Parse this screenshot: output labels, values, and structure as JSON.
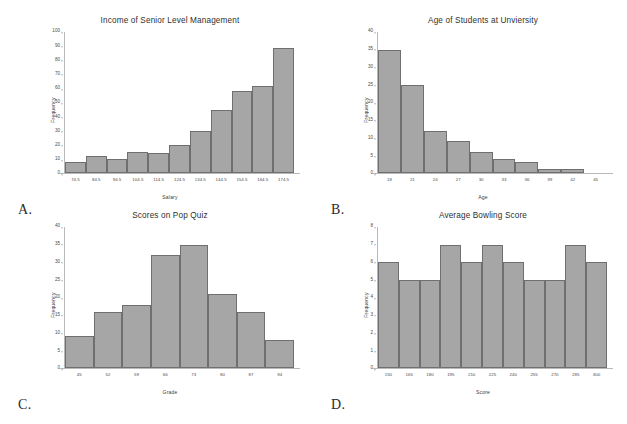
{
  "page": {
    "ghost_bleed_text": " ",
    "panel_letters": [
      "A.",
      "B.",
      "C.",
      "D."
    ]
  },
  "chart_data": [
    {
      "id": "income-senior-level-management",
      "panel": "A.",
      "type": "bar",
      "title": "Income of Senior Level Management",
      "xlabel": "Salary",
      "ylabel": "Frequency",
      "categories": [
        "74.5",
        "84.5",
        "94.5",
        "104.5",
        "114.5",
        "124.5",
        "134.5",
        "144.5",
        "154.5",
        "164.5",
        "174.5"
      ],
      "values": [
        8,
        12,
        10,
        15,
        14,
        20,
        30,
        45,
        58,
        62,
        89
      ],
      "yticks": [
        0,
        10,
        20,
        30,
        40,
        50,
        60,
        70,
        80,
        90,
        100
      ],
      "ylim": [
        0,
        100
      ],
      "grid": false,
      "legend": "none",
      "bar_fill": "#a6a6a6",
      "bar_stroke": "#6f6f6f"
    },
    {
      "id": "age-of-students-at-university",
      "panel": "B.",
      "type": "bar",
      "title": "Age of Students at Unviersity",
      "xlabel": "Age",
      "ylabel": "Frequency",
      "categories": [
        "18",
        "21",
        "24",
        "27",
        "30",
        "33",
        "36",
        "39",
        "42",
        "45"
      ],
      "values": [
        35,
        25,
        12,
        9,
        6,
        4,
        3,
        1,
        1
      ],
      "yticks": [
        0,
        5,
        10,
        15,
        20,
        25,
        30,
        35,
        40
      ],
      "ylim": [
        0,
        40
      ],
      "grid": false,
      "legend": "none",
      "bar_fill": "#a6a6a6",
      "bar_stroke": "#6f6f6f"
    },
    {
      "id": "scores-on-pop-quiz",
      "panel": "C.",
      "type": "bar",
      "title": "Scores on Pop Quiz",
      "xlabel": "Grade",
      "ylabel": "Frequency",
      "categories": [
        "45",
        "52",
        "59",
        "66",
        "73",
        "80",
        "87",
        "94"
      ],
      "values": [
        9,
        16,
        18,
        32,
        35,
        21,
        16,
        8
      ],
      "yticks": [
        0,
        5,
        10,
        15,
        20,
        25,
        30,
        35,
        40
      ],
      "ylim": [
        0,
        40
      ],
      "grid": false,
      "legend": "none",
      "bar_fill": "#a6a6a6",
      "bar_stroke": "#6f6f6f"
    },
    {
      "id": "average-bowling-score",
      "panel": "D.",
      "type": "bar",
      "title": "Average Bowling Score",
      "xlabel": "Score",
      "ylabel": "Frequency",
      "categories": [
        "150",
        "165",
        "180",
        "195",
        "210",
        "225",
        "240",
        "255",
        "270",
        "285",
        "300"
      ],
      "values": [
        6,
        5,
        5,
        7,
        6,
        7,
        6,
        5,
        5,
        7,
        6
      ],
      "yticks": [
        0,
        1,
        2,
        3,
        4,
        5,
        6,
        7,
        8
      ],
      "ylim": [
        0,
        8
      ],
      "grid": false,
      "legend": "none",
      "bar_fill": "#a6a6a6",
      "bar_stroke": "#6f6f6f"
    }
  ]
}
